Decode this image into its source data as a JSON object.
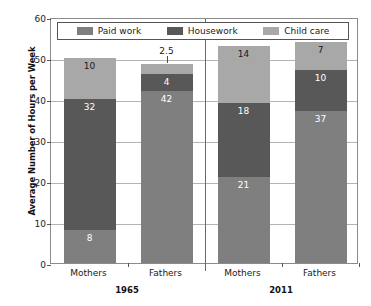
{
  "chart_data": {
    "type": "bar",
    "stacked": true,
    "title": "",
    "subtitle": "",
    "xlabel": "",
    "ylabel": "Average Number of Hours per Week",
    "ylim": [
      0,
      60
    ],
    "yticks": [
      0,
      10,
      20,
      30,
      40,
      50,
      60
    ],
    "grid": true,
    "legend_position": "top-inside",
    "categories": [
      "Mothers",
      "Fathers",
      "Mothers",
      "Fathers"
    ],
    "groups": [
      {
        "label": "1965",
        "categories": [
          "Mothers",
          "Fathers"
        ]
      },
      {
        "label": "2011",
        "categories": [
          "Mothers",
          "Fathers"
        ]
      }
    ],
    "series": [
      {
        "name": "Paid work",
        "color": "#7f7f7f",
        "values": [
          8,
          42,
          21,
          37
        ]
      },
      {
        "name": "Housework",
        "color": "#585858",
        "values": [
          32,
          4,
          18,
          10
        ]
      },
      {
        "name": "Child care",
        "color": "#a8a8a8",
        "values": [
          10,
          2.5,
          14,
          7
        ]
      }
    ],
    "bars": [
      {
        "group": "1965",
        "category": "Mothers",
        "total": 50,
        "segments": [
          {
            "series": "Paid work",
            "value": 8,
            "label": "8",
            "label_color": "light"
          },
          {
            "series": "Housework",
            "value": 32,
            "label": "32",
            "label_color": "light"
          },
          {
            "series": "Child care",
            "value": 10,
            "label": "10",
            "label_color": "dark"
          }
        ]
      },
      {
        "group": "1965",
        "category": "Fathers",
        "total": 48.5,
        "segments": [
          {
            "series": "Paid work",
            "value": 42,
            "label": "42",
            "label_color": "light"
          },
          {
            "series": "Housework",
            "value": 4,
            "label": "4",
            "label_color": "light"
          },
          {
            "series": "Child care",
            "value": 2.5,
            "label": "2.5",
            "label_color": "dark",
            "callout": true
          }
        ]
      },
      {
        "group": "2011",
        "category": "Mothers",
        "total": 53,
        "segments": [
          {
            "series": "Paid work",
            "value": 21,
            "label": "21",
            "label_color": "light"
          },
          {
            "series": "Housework",
            "value": 18,
            "label": "18",
            "label_color": "light"
          },
          {
            "series": "Child care",
            "value": 14,
            "label": "14",
            "label_color": "dark"
          }
        ]
      },
      {
        "group": "2011",
        "category": "Fathers",
        "total": 54,
        "segments": [
          {
            "series": "Paid work",
            "value": 37,
            "label": "37",
            "label_color": "light"
          },
          {
            "series": "Housework",
            "value": 10,
            "label": "10",
            "label_color": "light"
          },
          {
            "series": "Child care",
            "value": 7,
            "label": "7",
            "label_color": "dark"
          }
        ]
      }
    ]
  },
  "axis": {
    "y_title": "Average Number of Hours per Week",
    "y_tick_labels": [
      "0",
      "10",
      "20",
      "30",
      "40",
      "50",
      "60"
    ],
    "x_tick_labels": [
      "Mothers",
      "Fathers",
      "Mothers",
      "Fathers"
    ],
    "group_labels": [
      "1965",
      "2011"
    ]
  },
  "legend": {
    "items": [
      {
        "label": "Paid work",
        "color": "#7f7f7f"
      },
      {
        "label": "Housework",
        "color": "#585858"
      },
      {
        "label": "Child care",
        "color": "#a8a8a8"
      }
    ]
  },
  "colors": {
    "paid_work": "#7f7f7f",
    "housework": "#585858",
    "child_care": "#a8a8a8",
    "grid": "#b4b4b4",
    "frame": "#8a8a8a",
    "divider": "#6a6a6a",
    "text": "#1a1a1a"
  }
}
